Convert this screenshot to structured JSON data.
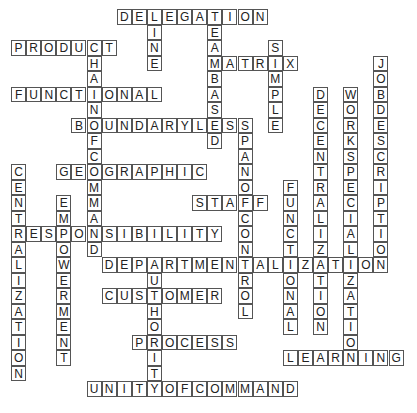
{
  "puzzle": {
    "type": "crossword-solution",
    "grid": {
      "cols": 26,
      "rows": 25,
      "origin_x": 11,
      "origin_y": 9,
      "cell_w": 15.1,
      "cell_h": 15.5
    },
    "colors": {
      "border": "#555555",
      "text": "#222222",
      "background": "#ffffff"
    },
    "words": [
      {
        "word": "DELEGATION",
        "dir": "across",
        "row": 0,
        "col": 7
      },
      {
        "word": "LINE",
        "dir": "down",
        "row": 0,
        "col": 9
      },
      {
        "word": "TEAMBASED",
        "dir": "down",
        "row": 0,
        "col": 13
      },
      {
        "word": "PRODUCT",
        "dir": "across",
        "row": 2,
        "col": 0
      },
      {
        "word": "CHAINOFCOMMAND",
        "dir": "down",
        "row": 2,
        "col": 5
      },
      {
        "word": "SIMPLE",
        "dir": "down",
        "row": 2,
        "col": 17
      },
      {
        "word": "MATRIX",
        "dir": "across",
        "row": 3,
        "col": 13
      },
      {
        "word": "JOBDESCRIPTION",
        "dir": "down",
        "row": 3,
        "col": 24
      },
      {
        "word": "FUNCTIONAL",
        "dir": "across",
        "row": 5,
        "col": 0
      },
      {
        "word": "DECENTRALIZATION",
        "dir": "down",
        "row": 5,
        "col": 20
      },
      {
        "word": "WORKSPECIALIZATION",
        "dir": "down",
        "row": 5,
        "col": 22
      },
      {
        "word": "BOUNDARYLESS",
        "dir": "across",
        "row": 7,
        "col": 4
      },
      {
        "word": "SPANOFCONTROL",
        "dir": "down",
        "row": 7,
        "col": 15
      },
      {
        "word": "GEOGRAPHIC",
        "dir": "across",
        "row": 10,
        "col": 3
      },
      {
        "word": "CENTRALIZATION",
        "dir": "down",
        "row": 10,
        "col": 0
      },
      {
        "word": "FUNCTIONAL",
        "dir": "down",
        "row": 11,
        "col": 18
      },
      {
        "word": "STAFF",
        "dir": "across",
        "row": 12,
        "col": 12
      },
      {
        "word": "EMPOWERMENT",
        "dir": "down",
        "row": 12,
        "col": 3
      },
      {
        "word": "RESPONSIBILITY",
        "dir": "across",
        "row": 14,
        "col": 0
      },
      {
        "word": "DEPARTMENTALIZATION",
        "dir": "across",
        "row": 16,
        "col": 6
      },
      {
        "word": "AUTHORITY",
        "dir": "down",
        "row": 16,
        "col": 9
      },
      {
        "word": "CUSTOMER",
        "dir": "across",
        "row": 18,
        "col": 6
      },
      {
        "word": "PROCESS",
        "dir": "across",
        "row": 21,
        "col": 8
      },
      {
        "word": "LEARNING",
        "dir": "across",
        "row": 22,
        "col": 18
      },
      {
        "word": "UNITYOFCOMMAND",
        "dir": "across",
        "row": 24,
        "col": 5
      }
    ]
  }
}
